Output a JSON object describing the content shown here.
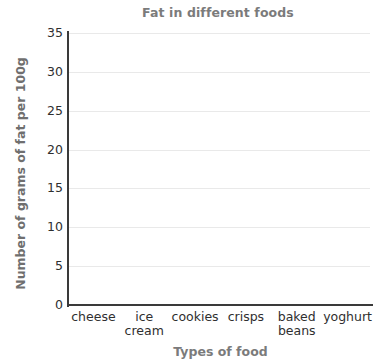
{
  "chart_data": {
    "type": "bar",
    "title": "Fat in different foods",
    "xlabel": "Types of food",
    "ylabel": "Number of grams of fat per 100g",
    "categories": [
      "cheese",
      "ice cream",
      "cookies",
      "crisps",
      "baked beans",
      "yoghurt"
    ],
    "category_lines": [
      [
        "cheese"
      ],
      [
        "ice",
        "cream"
      ],
      [
        "cookies"
      ],
      [
        "crisps"
      ],
      [
        "baked",
        "beans"
      ],
      [
        "yoghurt"
      ]
    ],
    "values": [
      null,
      null,
      null,
      null,
      null,
      null
    ],
    "ylim": [
      0,
      35
    ],
    "ytick_step": 5,
    "yticks": [
      0,
      5,
      10,
      15,
      20,
      25,
      30,
      35
    ],
    "ytick_labels": [
      "0",
      "5",
      "10",
      "15",
      "20",
      "25",
      "30",
      "35"
    ],
    "grid": true,
    "grid_axis": "y",
    "legend": false,
    "legend_position": "none",
    "note": "blank chart template - no bars plotted"
  },
  "colors": {
    "background": "#ffffff",
    "title": "#7b7b7b",
    "axis_title": "#6f6f6f",
    "tick_label": "#2f2f2f",
    "gridline": "#e9e9e9",
    "spine": "#3a3a3a"
  }
}
